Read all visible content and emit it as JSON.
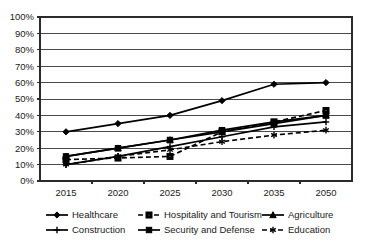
{
  "chart_data": {
    "type": "line",
    "title": "",
    "subtitle": "",
    "xlabel": "",
    "ylabel": "",
    "grid": true,
    "grid_orientation": "horizontal",
    "legend_position": "bottom",
    "categories": [
      "2015",
      "2020",
      "2025",
      "2030",
      "2035",
      "2050"
    ],
    "x_tick_labels": [
      "2015",
      "2020",
      "2025",
      "2030",
      "2035",
      "2050"
    ],
    "y_tick_labels": [
      "0%",
      "10%",
      "20%",
      "30%",
      "40%",
      "50%",
      "60%",
      "70%",
      "80%",
      "90%",
      "100%"
    ],
    "y_tick_values": [
      0,
      10,
      20,
      30,
      40,
      50,
      60,
      70,
      80,
      90,
      100
    ],
    "ylim": [
      0,
      100
    ],
    "y_unit": "%",
    "series": [
      {
        "name": "Healthcare",
        "values": [
          30,
          35,
          40,
          49,
          59,
          60
        ],
        "line_style": "solid",
        "marker": "diamond",
        "color": "#000000"
      },
      {
        "name": "Hospitality and Tourism",
        "values": [
          13,
          14,
          15,
          30,
          36,
          43
        ],
        "line_style": "dashed",
        "marker": "square-hollow",
        "color": "#000000"
      },
      {
        "name": "Agriculture",
        "values": [
          15,
          20,
          25,
          30,
          35,
          40
        ],
        "line_style": "solid",
        "marker": "triangle",
        "color": "#000000"
      },
      {
        "name": "Construction",
        "values": [
          10,
          15,
          21,
          27,
          33,
          36
        ],
        "line_style": "solid",
        "marker": "cross",
        "color": "#000000"
      },
      {
        "name": "Security and Defense",
        "values": [
          15,
          20,
          25,
          31,
          36,
          40
        ],
        "line_style": "solid",
        "marker": "square",
        "color": "#000000"
      },
      {
        "name": "Education",
        "values": [
          10,
          15,
          19,
          24,
          28,
          31
        ],
        "line_style": "dashed",
        "marker": "asterisk",
        "color": "#000000"
      }
    ],
    "legend": [
      {
        "label": "Healthcare",
        "marker": "diamond",
        "line_style": "solid"
      },
      {
        "label": "Hospitality and Tourism",
        "marker": "square-hollow",
        "line_style": "dashed"
      },
      {
        "label": "Agriculture",
        "marker": "triangle",
        "line_style": "solid"
      },
      {
        "label": "Construction",
        "marker": "cross",
        "line_style": "solid"
      },
      {
        "label": "Security and Defense",
        "marker": "square",
        "line_style": "solid"
      },
      {
        "label": "Education",
        "marker": "asterisk",
        "line_style": "dashed"
      }
    ]
  },
  "colors": {
    "background": "#ffffff",
    "foreground": "#000000",
    "grid": "#4a4a4a",
    "frame": "#2b2b2b"
  }
}
